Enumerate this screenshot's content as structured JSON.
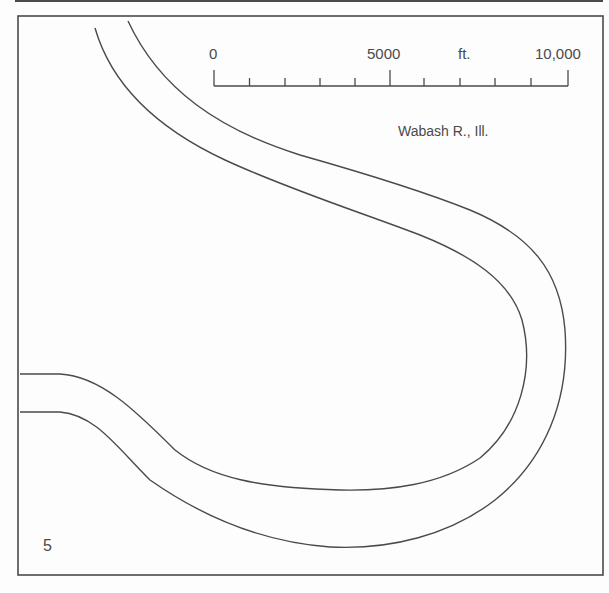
{
  "figure": {
    "panel_number": "5",
    "location_label": "Wabash R., Ill.",
    "scale_bar": {
      "unit": "ft.",
      "labels": [
        {
          "text": "0",
          "value": 0
        },
        {
          "text": "5000",
          "value": 5000
        },
        {
          "text": "10,000",
          "value": 10000
        }
      ],
      "tick_interval": 1000,
      "max": 10000
    },
    "river": {
      "name": "Wabash River",
      "banks": [
        "inner-bank",
        "outer-bank"
      ]
    },
    "colors": {
      "line": "#4a4a4a",
      "background": "#fdfdfd"
    }
  }
}
